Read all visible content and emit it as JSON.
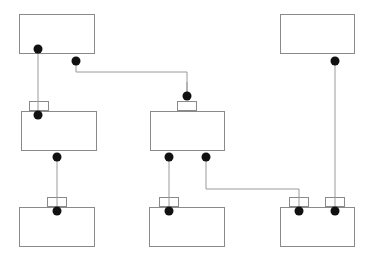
{
  "diagram": {
    "type": "block-connection-diagram",
    "colors": {
      "background": "#ffffff",
      "box_stroke": "#8a8a8a",
      "line_stroke": "#9a9a9a",
      "dot_fill": "#111111"
    },
    "boxes": [
      {
        "id": "box-top-left",
        "x": 19,
        "y": 14,
        "w": 75,
        "h": 39,
        "tabs": []
      },
      {
        "id": "box-top-right",
        "x": 280,
        "y": 14,
        "w": 74,
        "h": 39,
        "tabs": []
      },
      {
        "id": "box-mid-left",
        "x": 21,
        "y": 111,
        "w": 75,
        "h": 39,
        "tabs": [
          {
            "x": 29,
            "w": 19
          }
        ]
      },
      {
        "id": "box-mid-center",
        "x": 150,
        "y": 111,
        "w": 74,
        "h": 39,
        "tabs": [
          {
            "x": 177,
            "w": 19
          }
        ]
      },
      {
        "id": "box-bottom-left",
        "x": 19,
        "y": 207,
        "w": 75,
        "h": 39,
        "tabs": [
          {
            "x": 47,
            "w": 19
          }
        ]
      },
      {
        "id": "box-bottom-center",
        "x": 149,
        "y": 207,
        "w": 75,
        "h": 39,
        "tabs": [
          {
            "x": 159,
            "w": 19
          }
        ]
      },
      {
        "id": "box-bottom-right",
        "x": 280,
        "y": 207,
        "w": 74,
        "h": 39,
        "tabs": [
          {
            "x": 289,
            "w": 19
          },
          {
            "x": 325,
            "w": 19
          }
        ]
      }
    ],
    "connectors": [
      {
        "id": "conn-topleft-to-midleft",
        "points": [
          [
            38,
            49
          ],
          [
            38,
            115
          ]
        ]
      },
      {
        "id": "conn-topleft-to-midcenter",
        "points": [
          [
            76,
            61
          ],
          [
            76,
            72
          ],
          [
            187,
            72
          ],
          [
            187,
            96
          ]
        ]
      },
      {
        "id": "conn-topright-to-bottomright",
        "points": [
          [
            335,
            61
          ],
          [
            335,
            211
          ]
        ]
      },
      {
        "id": "conn-midleft-to-bottomleft",
        "points": [
          [
            57,
            157
          ],
          [
            57,
            211
          ]
        ]
      },
      {
        "id": "conn-midcenter-to-bottomcenter",
        "points": [
          [
            169,
            157
          ],
          [
            169,
            211
          ]
        ]
      },
      {
        "id": "conn-midcenter-to-bottomright",
        "points": [
          [
            206,
            157
          ],
          [
            206,
            189
          ],
          [
            299,
            189
          ],
          [
            299,
            211
          ]
        ]
      }
    ],
    "dots": [
      [
        38,
        49
      ],
      [
        76,
        61
      ],
      [
        335,
        61
      ],
      [
        38,
        115
      ],
      [
        187,
        96
      ],
      [
        57,
        157
      ],
      [
        169,
        157
      ],
      [
        206,
        157
      ],
      [
        57,
        211
      ],
      [
        169,
        211
      ],
      [
        299,
        211
      ],
      [
        335,
        211
      ]
    ]
  }
}
